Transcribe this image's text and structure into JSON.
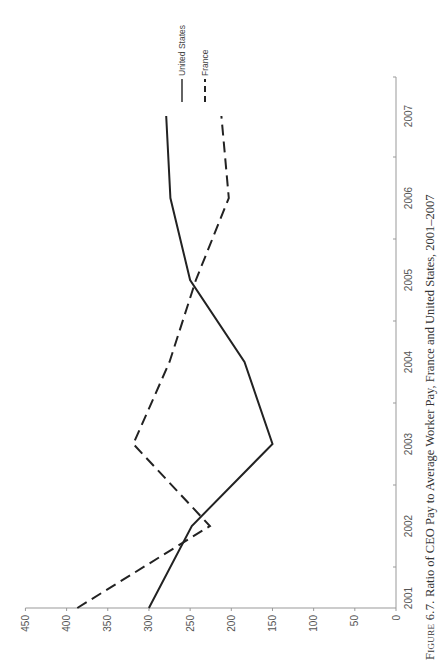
{
  "chart_data": {
    "type": "line",
    "orientation": "rotated-90-ccw",
    "title": "",
    "caption": {
      "figure_label": "Figure 6.7.",
      "text": "Ratio of CEO Pay to Average Worker Pay, France and United States, 2001–2007"
    },
    "xlabel": "",
    "ylabel": "",
    "categories": [
      "2001",
      "2002",
      "2003",
      "2004",
      "2005",
      "2006",
      "2007"
    ],
    "y_ticks": [
      0,
      50,
      100,
      150,
      200,
      250,
      300,
      350,
      400,
      450
    ],
    "ylim": [
      0,
      450
    ],
    "grid": false,
    "legend_position": "top-right (rotated)",
    "series": [
      {
        "name": "United States",
        "style": "solid",
        "color": "#222222",
        "values": [
          300,
          248,
          150,
          184,
          250,
          274,
          279
        ]
      },
      {
        "name": "France",
        "style": "dashed",
        "color": "#222222",
        "values": [
          387,
          226,
          319,
          275,
          243,
          203,
          212
        ]
      }
    ]
  },
  "colors": {
    "line": "#222222",
    "axis": "#999999",
    "text": "#555555"
  }
}
